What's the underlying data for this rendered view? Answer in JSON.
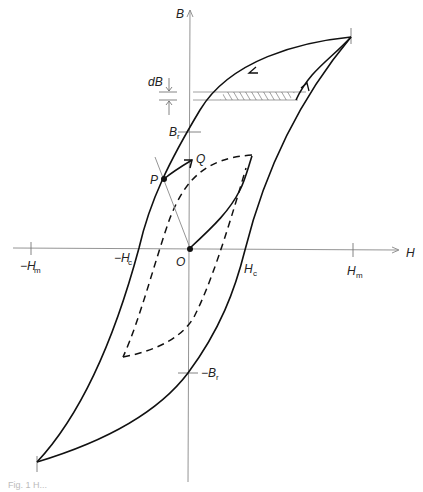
{
  "diagram": {
    "type": "hysteresis-loop",
    "axes": {
      "x": {
        "label": "H"
      },
      "y": {
        "label": "B"
      }
    },
    "origin_label": "O",
    "x_ticks": [
      {
        "label": "−H",
        "sub": "m",
        "pos": "negative-max"
      },
      {
        "label": "−H",
        "sub": "c",
        "pos": "negative-coercive"
      },
      {
        "label": "H",
        "sub": "c",
        "pos": "coercive"
      },
      {
        "label": "H",
        "sub": "m",
        "pos": "max"
      }
    ],
    "y_ticks": [
      {
        "label": "B",
        "sub": "r",
        "pos": "remanence"
      },
      {
        "label": "−B",
        "sub": "r",
        "pos": "negative-remanence"
      }
    ],
    "points": [
      {
        "label": "P"
      },
      {
        "label": "Q"
      }
    ],
    "annotations": {
      "dB_label": "dB"
    },
    "curves": [
      "major hysteresis loop (solid)",
      "minor hysteresis loop (dashed)",
      "initial magnetization curve from O",
      "recoil path P to Q",
      "load line through O and P",
      "hatched energy strip of width dB"
    ],
    "colors": {
      "line": "#111111",
      "thin": "#777777",
      "background": "#ffffff"
    }
  },
  "caption": "Fig. 1 H..."
}
